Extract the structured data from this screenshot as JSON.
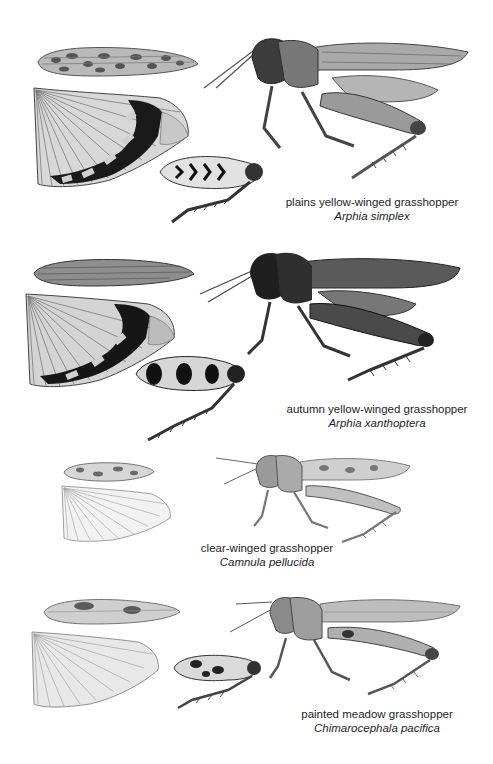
{
  "plate": {
    "background": "#ffffff",
    "species": [
      {
        "common_name": "plains yellow-winged grasshopper",
        "scientific_name": "Arphia simplex",
        "illustrations": [
          "forewing-icon",
          "hindwing-icon",
          "hind-leg-icon",
          "grasshopper-body-icon"
        ]
      },
      {
        "common_name": "autumn yellow-winged grasshopper",
        "scientific_name": "Arphia xanthoptera",
        "illustrations": [
          "forewing-icon",
          "hindwing-icon",
          "hind-leg-icon",
          "grasshopper-body-icon"
        ]
      },
      {
        "common_name": "clear-winged grasshopper",
        "scientific_name": "Camnula pellucida",
        "illustrations": [
          "forewing-icon",
          "hindwing-icon",
          "grasshopper-body-icon"
        ]
      },
      {
        "common_name": "painted meadow grasshopper",
        "scientific_name": "Chimarocephala pacifica",
        "illustrations": [
          "forewing-icon",
          "hindwing-icon",
          "hind-leg-icon",
          "grasshopper-body-icon"
        ]
      }
    ]
  }
}
